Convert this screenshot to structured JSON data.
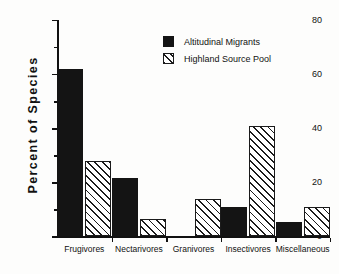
{
  "chart_data": {
    "type": "bar",
    "title": "",
    "xlabel": "",
    "ylabel": "Percent  of  Species",
    "ylim": [
      0,
      80
    ],
    "yticks": [
      0,
      20,
      40,
      60,
      80
    ],
    "ytick_labels": [
      "0",
      "20",
      "40",
      "60",
      "80"
    ],
    "yminor_ticks": [
      10,
      30,
      50,
      70
    ],
    "grid": false,
    "legend_position": "upper-center-right",
    "categories": [
      "Frugivores",
      "Nectarivores",
      "Granivores",
      "Insectivores",
      "Miscellaneous"
    ],
    "series": [
      {
        "name": "Altitudinal Migrants",
        "fill": "solid-black",
        "color": "#141414",
        "values": [
          62,
          21.5,
          0,
          11,
          5.5
        ]
      },
      {
        "name": "Highland Source Pool",
        "fill": "diagonal-hatch",
        "color": "#1b1b1b",
        "values": [
          28,
          6.5,
          14,
          41,
          11
        ]
      }
    ]
  },
  "legend": {
    "entries": [
      {
        "label": "Altitudinal Migrants",
        "swatch": "solid-swatch"
      },
      {
        "label": "Highland Source Pool",
        "swatch": "hatched-swatch"
      }
    ]
  }
}
